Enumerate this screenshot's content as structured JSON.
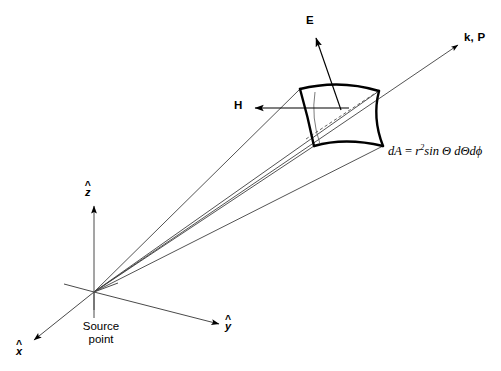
{
  "figure": {
    "background_color": "#ffffff",
    "line_color": "#000000",
    "thin_line_color": "#3a3a3a",
    "width": 501,
    "height": 371
  },
  "labels": {
    "e_field": "E",
    "h_field": "H",
    "wave_vector": "k, P",
    "source_point_line1": "Source",
    "source_point_line2": "point",
    "axis_x": "x",
    "axis_y": "y",
    "axis_z": "z",
    "hat_glyph": "^"
  },
  "formula": {
    "lhs": "dA",
    "equals": "=",
    "r_symbol": "r",
    "r_exponent": "2",
    "sin_text": "sin",
    "theta_symbol": "Θ",
    "d_theta": "dΘ",
    "d_phi": "dϕ",
    "full_text": "dA = r2sin Θ dΘdϕ"
  },
  "geometry": {
    "origin": {
      "x": 94,
      "y": 292
    },
    "patch": {
      "top_left": {
        "x": 300,
        "y": 89
      },
      "top_right": {
        "x": 379,
        "y": 91
      },
      "bottom_right": {
        "x": 383,
        "y": 146
      },
      "bottom_left": {
        "x": 314,
        "y": 146
      }
    },
    "arrows": {
      "e_tip": {
        "x": 315,
        "y": 35
      },
      "e_tail": {
        "x": 341,
        "y": 110
      },
      "h_tip": {
        "x": 253,
        "y": 108
      },
      "h_tail": {
        "x": 349,
        "y": 108
      },
      "kp_tip": {
        "x": 461,
        "y": 43
      },
      "kp_tail": {
        "x": 94,
        "y": 292
      },
      "z_tip": {
        "x": 94,
        "y": 203
      },
      "y_tip": {
        "x": 222,
        "y": 325
      },
      "x_tip": {
        "x": 31,
        "y": 342
      }
    }
  }
}
